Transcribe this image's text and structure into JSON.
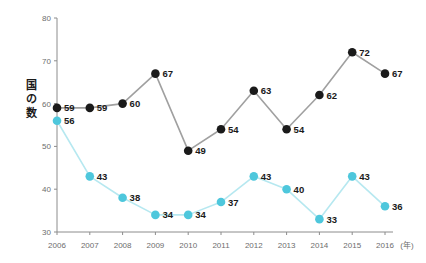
{
  "chart_data": {
    "type": "line",
    "title": "",
    "subtitle": "",
    "xlabel": "(年)",
    "ylabel": "国の数",
    "x": [
      2006,
      2007,
      2008,
      2009,
      2010,
      2011,
      2012,
      2013,
      2014,
      2015,
      2016
    ],
    "categories": [
      "2006",
      "2007",
      "2008",
      "2009",
      "2010",
      "2011",
      "2012",
      "2013",
      "2014",
      "2015",
      "2016"
    ],
    "xtick_labels": [
      "2006",
      "2007",
      "2008",
      "2009",
      "2010",
      "2011",
      "2012",
      "2013",
      "2014",
      "2015",
      "2016"
    ],
    "ytick_labels": [
      "30",
      "40",
      "50",
      "60",
      "70",
      "80"
    ],
    "yticks": [
      30,
      40,
      50,
      60,
      70,
      80
    ],
    "ylim": [
      30,
      80
    ],
    "xlim": [
      2006,
      2016
    ],
    "grid": false,
    "legend": "none",
    "series": [
      {
        "name": "dark-series",
        "color": "#1a1a1a",
        "line_color": "#a0a0a0",
        "values": [
          59,
          59,
          60,
          67,
          49,
          54,
          63,
          54,
          62,
          72,
          67
        ],
        "labels": [
          "59",
          "59",
          "60",
          "67",
          "49",
          "54",
          "63",
          "54",
          "62",
          "72",
          "67"
        ]
      },
      {
        "name": "cyan-series",
        "color": "#4ec7dc",
        "line_color": "#b6e8f0",
        "values": [
          56,
          43,
          38,
          34,
          34,
          37,
          43,
          40,
          33,
          43,
          36
        ],
        "labels": [
          "56",
          "43",
          "38",
          "34",
          "34",
          "37",
          "43",
          "40",
          "33",
          "43",
          "36"
        ]
      }
    ],
    "axis_color": "#8c8c8c",
    "background": "#ffffff"
  },
  "y_axis_title_chars": [
    "国",
    "の",
    "数"
  ]
}
